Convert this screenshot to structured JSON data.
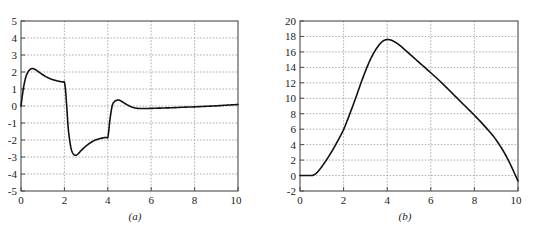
{
  "figure": {
    "background_color": "#ffffff",
    "curve_color": "#111111",
    "axis_color": "#4a4a4a",
    "grid_color": "#9a9a9a"
  },
  "panels": [
    {
      "caption": "(a)",
      "xlabel": "",
      "ylabel": "",
      "x_ticks": [
        "0",
        "2",
        "4",
        "6",
        "8",
        "10"
      ],
      "y_ticks": [
        "5",
        "4",
        "3",
        "2",
        "1",
        "0",
        "-1",
        "-2",
        "-3",
        "-4",
        "-5"
      ]
    },
    {
      "caption": "(b)",
      "xlabel": "",
      "ylabel": "",
      "x_ticks": [
        "0",
        "2",
        "4",
        "6",
        "8",
        "10"
      ],
      "y_ticks": [
        "20",
        "18",
        "16",
        "14",
        "12",
        "10",
        "8",
        "6",
        "4",
        "2",
        "0",
        "-2"
      ]
    }
  ],
  "chart_data": [
    {
      "type": "line",
      "title": "",
      "subtitle": "",
      "caption": "(a)",
      "xlabel": "",
      "ylabel": "",
      "xlim": [
        0,
        10
      ],
      "ylim": [
        -5,
        5
      ],
      "xticks": [
        0,
        2,
        4,
        6,
        8,
        10
      ],
      "yticks": [
        -5,
        -4,
        -3,
        -2,
        -1,
        0,
        1,
        2,
        3,
        4,
        5
      ],
      "grid": true,
      "grid_style": "dotted",
      "legend": null,
      "legend_position": "none",
      "annotations": [],
      "series": [
        {
          "name": "signal a",
          "x": [
            0.0,
            0.1,
            0.2,
            0.3,
            0.4,
            0.5,
            0.6,
            0.7,
            0.8,
            0.9,
            1.0,
            1.2,
            1.4,
            1.6,
            1.8,
            1.9,
            1.95,
            2.0,
            2.05,
            2.1,
            2.15,
            2.2,
            2.3,
            2.4,
            2.5,
            2.6,
            2.7,
            2.8,
            2.9,
            3.0,
            3.2,
            3.4,
            3.6,
            3.8,
            3.9,
            3.95,
            4.0,
            4.05,
            4.1,
            4.2,
            4.3,
            4.4,
            4.5,
            4.6,
            4.8,
            5.0,
            5.2,
            5.4,
            5.6,
            6.0,
            6.5,
            7.0,
            7.5,
            8.0,
            8.5,
            9.0,
            9.5,
            10.0
          ],
          "y": [
            0.0,
            0.95,
            1.6,
            1.95,
            2.13,
            2.2,
            2.18,
            2.11,
            2.02,
            1.93,
            1.84,
            1.69,
            1.58,
            1.5,
            1.44,
            1.42,
            1.41,
            1.4,
            0.95,
            0.1,
            -0.85,
            -1.6,
            -2.45,
            -2.8,
            -2.9,
            -2.85,
            -2.72,
            -2.58,
            -2.46,
            -2.35,
            -2.16,
            -2.02,
            -1.93,
            -1.87,
            -1.85,
            -1.85,
            -1.85,
            -1.4,
            -0.8,
            0.0,
            0.25,
            0.33,
            0.35,
            0.3,
            0.14,
            0.0,
            -0.1,
            -0.14,
            -0.15,
            -0.14,
            -0.12,
            -0.1,
            -0.07,
            -0.05,
            -0.02,
            0.01,
            0.05,
            0.09
          ],
          "color": "#111111",
          "style": "solid",
          "width": 1.6
        }
      ],
      "key_points": {
        "first_peak": {
          "x": 0.5,
          "y": 2.2
        },
        "plateau_before_drop": {
          "x": 2.0,
          "y": 1.4
        },
        "global_minimum": {
          "x": 2.5,
          "y": -2.9
        },
        "plateau_before_rise": {
          "x": 3.95,
          "y": -1.85
        },
        "second_peak": {
          "x": 4.5,
          "y": 0.35
        },
        "settle_min": {
          "x": 5.6,
          "y": -0.15
        },
        "end": {
          "x": 10.0,
          "y": 0.09
        }
      }
    },
    {
      "type": "line",
      "title": "",
      "subtitle": "",
      "caption": "(b)",
      "xlabel": "",
      "ylabel": "",
      "xlim": [
        0,
        10
      ],
      "ylim": [
        -2,
        20
      ],
      "xticks": [
        0,
        2,
        4,
        6,
        8,
        10
      ],
      "yticks": [
        -2,
        0,
        2,
        4,
        6,
        8,
        10,
        12,
        14,
        16,
        18,
        20
      ],
      "grid": true,
      "grid_style": "dotted",
      "legend": null,
      "legend_position": "none",
      "annotations": [],
      "series": [
        {
          "name": "signal b",
          "x": [
            0.0,
            0.2,
            0.4,
            0.55,
            0.6,
            0.7,
            0.8,
            0.9,
            1.0,
            1.2,
            1.4,
            1.6,
            1.8,
            2.0,
            2.2,
            2.4,
            2.6,
            2.8,
            3.0,
            3.2,
            3.4,
            3.6,
            3.8,
            4.0,
            4.2,
            4.4,
            4.6,
            4.8,
            5.0,
            5.5,
            6.0,
            6.5,
            7.0,
            7.5,
            8.0,
            8.5,
            9.0,
            9.5,
            10.0
          ],
          "y": [
            0.0,
            0.0,
            0.0,
            0.0,
            0.05,
            0.2,
            0.45,
            0.78,
            1.15,
            1.95,
            2.85,
            3.8,
            4.85,
            5.95,
            7.35,
            8.85,
            10.4,
            12.0,
            13.5,
            14.85,
            15.95,
            16.8,
            17.4,
            17.6,
            17.5,
            17.2,
            16.8,
            16.3,
            15.8,
            14.55,
            13.3,
            12.0,
            10.6,
            9.2,
            7.8,
            6.3,
            4.6,
            2.3,
            -0.7
          ],
          "color": "#111111",
          "style": "solid",
          "width": 1.6
        }
      ],
      "key_points": {
        "flat_start_end": {
          "x": 0.6,
          "y": 0.0
        },
        "global_maximum": {
          "x": 4.0,
          "y": 17.6
        },
        "crossing_at_x8": {
          "x": 8.0,
          "y": 7.8
        },
        "end": {
          "x": 10.0,
          "y": -0.7
        }
      }
    }
  ]
}
